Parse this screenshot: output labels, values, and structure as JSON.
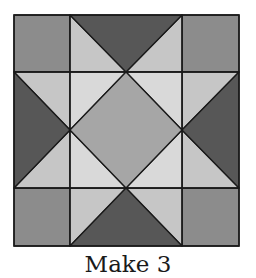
{
  "figure": {
    "type": "quilt-block-diagram",
    "block_name": "Sawtooth/Ohio-style star",
    "caption": "Make 3"
  },
  "colors": {
    "corner": "#8c8c8c",
    "dark": "#575757",
    "center": "#a6a6a6",
    "light_outer": "#c6c6c6",
    "light_inner": "#d9d9d9",
    "stroke": "#1a1a1a"
  },
  "geometry": {
    "left": 14,
    "top": 15,
    "right": 239,
    "bottom": 246,
    "grid_x": [
      14,
      70,
      126,
      182,
      239
    ],
    "grid_y": [
      15,
      72,
      130,
      188,
      246
    ]
  }
}
